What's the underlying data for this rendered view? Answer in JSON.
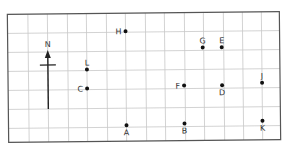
{
  "diagram": {
    "type": "grid-map",
    "colors": {
      "grid_line": "#c8c8c8",
      "border": "#555555",
      "point": "#111111",
      "label": "#333333",
      "arrow": "#222222"
    },
    "grid": {
      "columns": 14,
      "rows": 7,
      "x_lines": [
        8,
        28.5,
        48,
        68,
        87,
        107,
        126,
        146,
        165,
        185,
        204,
        224,
        243,
        262,
        280
      ],
      "y_lines": [
        13,
        32,
        51,
        70,
        89,
        108,
        127,
        141
      ]
    },
    "north_arrow": {
      "label": "N",
      "x": 48,
      "tip_y": 49,
      "tail_y": 108,
      "crossbar_y": 64,
      "crossbar_half_width": 8
    },
    "points": [
      {
        "label": "H",
        "x": 126,
        "y": 31,
        "label_pos": "left"
      },
      {
        "label": "G",
        "x": 203,
        "y": 48,
        "label_pos": "above"
      },
      {
        "label": "E",
        "x": 222,
        "y": 48,
        "label_pos": "above"
      },
      {
        "label": "L",
        "x": 87,
        "y": 69,
        "label_pos": "above"
      },
      {
        "label": "C",
        "x": 87,
        "y": 88,
        "label_pos": "left"
      },
      {
        "label": "F",
        "x": 184,
        "y": 86,
        "label_pos": "left"
      },
      {
        "label": "D",
        "x": 222,
        "y": 86,
        "label_pos": "below"
      },
      {
        "label": "J",
        "x": 262,
        "y": 84,
        "label_pos": "above"
      },
      {
        "label": "A",
        "x": 126,
        "y": 125,
        "label_pos": "below"
      },
      {
        "label": "B",
        "x": 184,
        "y": 124,
        "label_pos": "below"
      },
      {
        "label": "K",
        "x": 262,
        "y": 122,
        "label_pos": "below"
      }
    ]
  }
}
